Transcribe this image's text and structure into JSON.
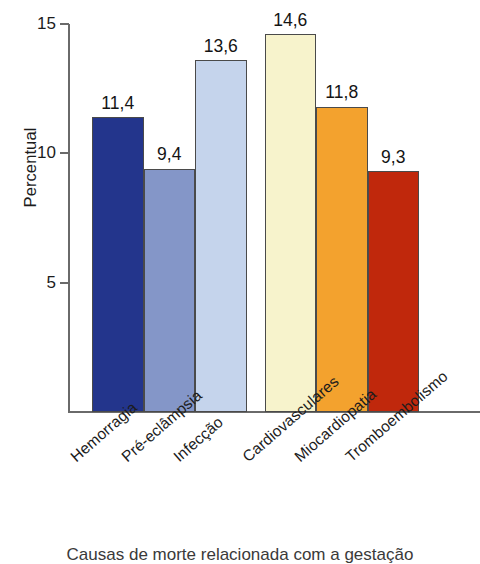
{
  "chart_data": {
    "type": "bar",
    "title": "",
    "xlabel": "Causas de morte relacionada com a gestação",
    "ylabel": "Percentual",
    "ylim": [
      0,
      15
    ],
    "yticks": [
      5,
      10,
      15
    ],
    "ytick_labels": [
      "5",
      "10",
      "15"
    ],
    "grid": false,
    "legend": "none",
    "decimal_separator": ",",
    "categories": [
      "Hemorragia",
      "Pré-eclâmpsia",
      "Infecção",
      "Cardiovasculares",
      "Miocardiopatia",
      "Tromboembolismo"
    ],
    "values": [
      11.4,
      9.4,
      13.6,
      14.6,
      11.8,
      9.3
    ],
    "value_labels": [
      "11,4",
      "9,4",
      "13,6",
      "14,6",
      "11,8",
      "9,3"
    ],
    "colors": [
      "#23358c",
      "#8496c8",
      "#c5d4ec",
      "#f7f3cc",
      "#f3a22e",
      "#c0280c"
    ],
    "groups": [
      {
        "name": "obstétricas",
        "category_indices": [
          0,
          1,
          2
        ]
      },
      {
        "name": "não-obstétricas",
        "category_indices": [
          3,
          4,
          5
        ]
      }
    ]
  },
  "axis": {
    "y_title": "Percentual",
    "x_title": "Causas de morte relacionada com a gestação"
  }
}
